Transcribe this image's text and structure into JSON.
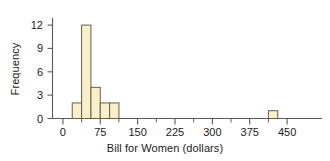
{
  "chart_data": {
    "type": "bar",
    "title": "",
    "subtitle": "",
    "xlabel": "Bill for Women (dollars)",
    "ylabel": "Frequency",
    "xlim": [
      -18.75,
      487.5
    ],
    "ylim": [
      0,
      13
    ],
    "xticks": [
      0,
      75,
      150,
      225,
      300,
      375,
      450
    ],
    "xtick_labels": [
      "0",
      "75",
      "150",
      "225",
      "300",
      "375",
      "450"
    ],
    "x_minor_ticks": [
      37.5,
      112.5,
      187.5,
      262.5,
      337.5,
      412.5
    ],
    "yticks": [
      0,
      3,
      6,
      9,
      12
    ],
    "ytick_labels": [
      "0",
      "3",
      "6",
      "9",
      "12"
    ],
    "grid": false,
    "legend": null,
    "bin_width": 18.75,
    "bins": [
      {
        "x0": 18.75,
        "x1": 37.5,
        "value": 2
      },
      {
        "x0": 37.5,
        "x1": 56.25,
        "value": 12
      },
      {
        "x0": 56.25,
        "x1": 75,
        "value": 4
      },
      {
        "x0": 75,
        "x1": 93.75,
        "value": 2
      },
      {
        "x0": 93.75,
        "x1": 112.5,
        "value": 2
      },
      {
        "x0": 412.5,
        "x1": 431.25,
        "value": 1
      }
    ],
    "categories": [
      "18.75-37.5",
      "37.5-56.25",
      "56.25-75",
      "75-93.75",
      "93.75-112.5",
      "412.5-431.25"
    ],
    "values": [
      2,
      12,
      4,
      2,
      2,
      1
    ],
    "colors": {
      "bar_fill": "#f8efcb",
      "bar_stroke": "#6b5f43",
      "axis": "#5a5a5a",
      "text": "#1a1a1a",
      "background": "#ffffff"
    }
  }
}
